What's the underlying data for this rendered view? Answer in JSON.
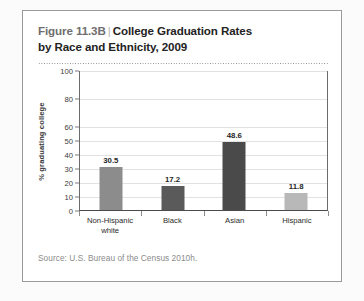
{
  "figure": {
    "label": "Figure 11.3B",
    "separator": "|",
    "title_line1": "College Graduation Rates",
    "title_line2": "by Race and Ethnicity, 2009",
    "source": "Source: U.S. Bureau of the Census 2010h."
  },
  "colors": {
    "card_border": "#9a9a9a",
    "axis": "#4a6b6b",
    "gridline": "#e2e2e2",
    "bar_non_hispanic_white": "#8c8c8c",
    "bar_black": "#5a5a5a",
    "bar_asian": "#4a4a4a",
    "bar_hispanic": "#b8b8b8",
    "value_label": "#1f1f1f",
    "source_text": "#8b8b8b"
  },
  "chart_data": {
    "type": "bar",
    "xlabel": "",
    "ylabel": "% graduating college",
    "categories": [
      "Non-Hispanic white",
      "Black",
      "Asian",
      "Hispanic"
    ],
    "category_lines": [
      [
        "Non-Hispanic",
        "white"
      ],
      [
        "Black"
      ],
      [
        "Asian"
      ],
      [
        "Hispanic"
      ]
    ],
    "values": [
      30.5,
      17.2,
      48.6,
      11.8
    ],
    "value_labels": [
      "30.5",
      "17.2",
      "48.6",
      "11.8"
    ],
    "bar_colors": [
      "#8c8c8c",
      "#5a5a5a",
      "#4a4a4a",
      "#b8b8b8"
    ],
    "ylim": [
      0,
      100
    ],
    "ytick_values": [
      0,
      10,
      20,
      30,
      40,
      50,
      60,
      80,
      100
    ],
    "ytick_labels": [
      "0",
      "10",
      "20",
      "30",
      "40",
      "50",
      "60",
      "80",
      "100"
    ],
    "grid": true,
    "legend": false,
    "source": "Source: U.S. Bureau of the Census 2010h."
  }
}
